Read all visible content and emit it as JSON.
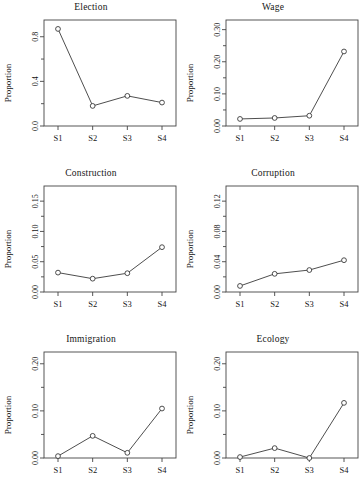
{
  "figure": {
    "layout": "2 columns x 3 rows",
    "ylabel": "Proportion",
    "categories": [
      "S1",
      "S2",
      "S3",
      "S4"
    ],
    "marker": "open-circle",
    "line_color": "#3a3a3a"
  },
  "chart_data": [
    {
      "type": "line",
      "title": "Election",
      "categories": [
        "S1",
        "S2",
        "S3",
        "S4"
      ],
      "values": [
        0.87,
        0.18,
        0.27,
        0.21
      ],
      "xlabel": "",
      "ylabel": "Proportion",
      "ylim": [
        0.0,
        0.95
      ],
      "yticks": [
        0.0,
        0.4,
        0.8
      ],
      "ytick_labels": [
        "0.0",
        "0.4",
        "0.8"
      ],
      "grid": false,
      "legend": "none"
    },
    {
      "type": "line",
      "title": "Wage",
      "categories": [
        "S1",
        "S2",
        "S3",
        "S4"
      ],
      "values": [
        0.022,
        0.025,
        0.032,
        0.232
      ],
      "xlabel": "",
      "ylabel": "Proportion",
      "ylim": [
        0.0,
        0.33
      ],
      "yticks": [
        0.0,
        0.1,
        0.2,
        0.3
      ],
      "ytick_labels": [
        "0.00",
        "0.10",
        "0.20",
        "0.30"
      ],
      "grid": false,
      "legend": "none"
    },
    {
      "type": "line",
      "title": "Construction",
      "categories": [
        "S1",
        "S2",
        "S3",
        "S4"
      ],
      "values": [
        0.032,
        0.022,
        0.031,
        0.074
      ],
      "xlabel": "",
      "ylabel": "Proportion",
      "ylim": [
        0.0,
        0.175
      ],
      "yticks": [
        0.0,
        0.05,
        0.1,
        0.15
      ],
      "ytick_labels": [
        "0.00",
        "0.05",
        "0.10",
        "0.15"
      ],
      "grid": false,
      "legend": "none"
    },
    {
      "type": "line",
      "title": "Corruption",
      "categories": [
        "S1",
        "S2",
        "S3",
        "S4"
      ],
      "values": [
        0.008,
        0.024,
        0.029,
        0.042
      ],
      "xlabel": "",
      "ylabel": "Proportion",
      "ylim": [
        0.0,
        0.14
      ],
      "yticks": [
        0.0,
        0.04,
        0.08,
        0.12
      ],
      "ytick_labels": [
        "0.00",
        "0.04",
        "0.08",
        "0.12"
      ],
      "grid": false,
      "legend": "none"
    },
    {
      "type": "line",
      "title": "Immigration",
      "categories": [
        "S1",
        "S2",
        "S3",
        "S4"
      ],
      "values": [
        0.004,
        0.047,
        0.011,
        0.105
      ],
      "xlabel": "",
      "ylabel": "Proportion",
      "ylim": [
        0.0,
        0.225
      ],
      "yticks": [
        0.0,
        0.1,
        0.2
      ],
      "ytick_labels": [
        "0.00",
        "0.10",
        "0.20"
      ],
      "grid": false,
      "legend": "none"
    },
    {
      "type": "line",
      "title": "Ecology",
      "categories": [
        "S1",
        "S2",
        "S3",
        "S4"
      ],
      "values": [
        0.002,
        0.021,
        0.0,
        0.117
      ],
      "xlabel": "",
      "ylabel": "Proportion",
      "ylim": [
        0.0,
        0.225
      ],
      "yticks": [
        0.0,
        0.1,
        0.2
      ],
      "ytick_labels": [
        "0.00",
        "0.10",
        "0.20"
      ],
      "grid": false,
      "legend": "none"
    }
  ]
}
